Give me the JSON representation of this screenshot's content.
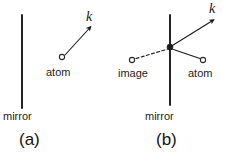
{
  "figure": {
    "background_color": "#ffffff",
    "stroke_color": "#1a1a1a",
    "width": 226,
    "height": 163,
    "panels": [
      {
        "id": "a",
        "caption": "(a)",
        "labels": {
          "wavevector": "k",
          "atom": "atom",
          "mirror": "mirror"
        },
        "elements": {
          "mirror_line": {
            "x": 22,
            "y1": 15,
            "y2": 108,
            "style": "solid"
          },
          "atom_marker": {
            "cx": 62,
            "cy": 57,
            "r": 2.6,
            "filled": false
          },
          "wavevector_arrow": {
            "x1": 65,
            "y1": 55,
            "x2": 92,
            "y2": 26,
            "style": "solid",
            "arrowhead": true
          }
        }
      },
      {
        "id": "b",
        "caption": "(b)",
        "labels": {
          "wavevector": "k",
          "image": "image",
          "atom": "atom",
          "mirror": "mirror"
        },
        "elements": {
          "mirror_line": {
            "x": 57,
            "y1": 15,
            "y2": 105,
            "style": "solid"
          },
          "intersection_dot": {
            "cx": 57,
            "cy": 47,
            "r": 2.8,
            "filled": true
          },
          "image_marker": {
            "cx": 19,
            "cy": 60,
            "r": 2.6,
            "filled": false
          },
          "atom_marker": {
            "cx": 90,
            "cy": 60,
            "r": 2.6,
            "filled": false
          },
          "image_ray": {
            "x1": 23,
            "y1": 58,
            "x2": 55,
            "y2": 49,
            "style": "dashed"
          },
          "atom_ray": {
            "x1": 87,
            "y1": 58,
            "x2": 59,
            "y2": 49,
            "style": "solid"
          },
          "wavevector_arrow": {
            "x1": 57,
            "y1": 47,
            "x2": 102,
            "y2": 19,
            "style": "solid",
            "arrowhead": true
          }
        }
      }
    ]
  }
}
